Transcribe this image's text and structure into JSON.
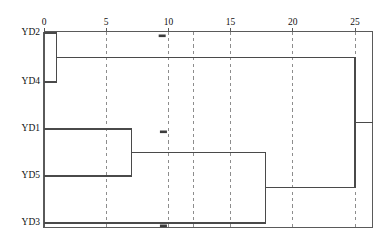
{
  "figure": {
    "kind": "dendrogram",
    "orientation": "horizontal-left-to-right",
    "background_color": "#ffffff",
    "line_color": "#4a4a4a",
    "grid_color": "#8d8d8d",
    "text_color": "#111111"
  },
  "axis": {
    "position": "top",
    "label": "",
    "min": 0,
    "max": 26.5,
    "ticks": [
      {
        "value": 0,
        "label": "0"
      },
      {
        "value": 5,
        "label": "5"
      },
      {
        "value": 10,
        "label": "10"
      },
      {
        "value": 15,
        "label": "15"
      },
      {
        "value": 20,
        "label": "20"
      },
      {
        "value": 25,
        "label": "25"
      }
    ],
    "gridlines": [
      5,
      10,
      12,
      15,
      20,
      25
    ],
    "gridline_style": "dashed"
  },
  "leaves": [
    {
      "label": "YD2",
      "order": 0
    },
    {
      "label": "YD4",
      "order": 1
    },
    {
      "label": "YD1",
      "order": 2
    },
    {
      "label": "YD5",
      "order": 3
    },
    {
      "label": "YD3",
      "order": 4
    }
  ],
  "chart_data": {
    "type": "line",
    "title": "",
    "xlabel": "",
    "ylabel": "",
    "xlim": [
      0,
      26.5
    ],
    "grid": true,
    "categories": [
      "YD2",
      "YD4",
      "YD1",
      "YD5",
      "YD3"
    ],
    "merges": [
      {
        "id": "m1",
        "children": [
          "YD2",
          "YD4"
        ],
        "distance": 1.0
      },
      {
        "id": "m2",
        "children": [
          "YD1",
          "YD5"
        ],
        "distance": 7.0
      },
      {
        "id": "m3",
        "children": [
          "m2",
          "YD3"
        ],
        "distance": 17.8
      },
      {
        "id": "m4",
        "children": [
          "m1",
          "m3"
        ],
        "distance": 25.0
      }
    ]
  },
  "specks": [
    {
      "x": 9.5,
      "y_leaf": "YD2"
    },
    {
      "x": 9.6,
      "y_leaf": "YD1"
    },
    {
      "x": 9.6,
      "y_leaf": "YD3"
    }
  ]
}
